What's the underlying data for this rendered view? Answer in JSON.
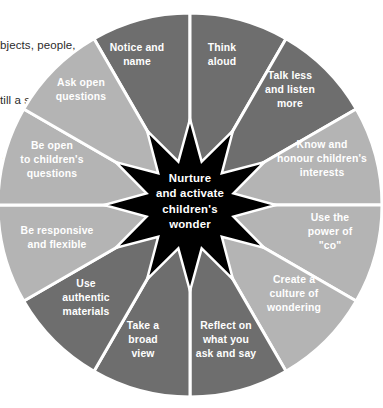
{
  "document_text": {
    "lines": [
      "bjects, people,",
      "till a sense",
      " Allow",
      "ell,"
    ]
  },
  "diagram": {
    "name": "nurture-and-activate-childrens-wonder-wheel",
    "core": {
      "lines": [
        "Nurture",
        "and activate",
        "children's",
        "wonder"
      ],
      "shape": "12-point-star",
      "color": "#000000",
      "text_color": "#ffffff"
    },
    "colors": {
      "dark_segment": "#6e6e6e",
      "light_segment": "#b4b4b4",
      "divider": "#ffffff",
      "label_text": "#ffffff",
      "background": "#ffffff"
    },
    "segment_count": 12,
    "segments": [
      {
        "index": 0,
        "lines": [
          "Notice and",
          "name"
        ],
        "tone": "dark",
        "label_x": 137,
        "label_y": 58
      },
      {
        "index": 1,
        "lines": [
          "Think",
          "aloud"
        ],
        "tone": "dark",
        "label_x": 222,
        "label_y": 58
      },
      {
        "index": 2,
        "lines": [
          "Talk less",
          "and listen",
          "more"
        ],
        "tone": "dark",
        "label_x": 290,
        "label_y": 93
      },
      {
        "index": 3,
        "lines": [
          "Know and",
          "honour children's",
          "interests"
        ],
        "tone": "light",
        "label_x": 322,
        "label_y": 162
      },
      {
        "index": 4,
        "lines": [
          "Use the",
          "power of",
          "\"co\""
        ],
        "tone": "light",
        "label_x": 330,
        "label_y": 235
      },
      {
        "index": 5,
        "lines": [
          "Create a",
          "culture of",
          "wondering"
        ],
        "tone": "light",
        "label_x": 294,
        "label_y": 297
      },
      {
        "index": 6,
        "lines": [
          "Reflect on",
          "what you",
          "ask and say"
        ],
        "tone": "dark",
        "label_x": 226,
        "label_y": 343
      },
      {
        "index": 7,
        "lines": [
          "Take a",
          "broad",
          "view"
        ],
        "tone": "dark",
        "label_x": 143,
        "label_y": 343
      },
      {
        "index": 8,
        "lines": [
          "Use",
          "authentic",
          "materials"
        ],
        "tone": "dark",
        "label_x": 86,
        "label_y": 301
      },
      {
        "index": 9,
        "lines": [
          "Be responsive",
          "and flexible"
        ],
        "tone": "light",
        "label_x": 57,
        "label_y": 241
      },
      {
        "index": 10,
        "lines": [
          "Be open",
          "to children's",
          "questions"
        ],
        "tone": "light",
        "label_x": 52,
        "label_y": 163
      },
      {
        "index": 11,
        "lines": [
          "Ask open",
          "questions"
        ],
        "tone": "light",
        "label_x": 81,
        "label_y": 93
      }
    ]
  }
}
